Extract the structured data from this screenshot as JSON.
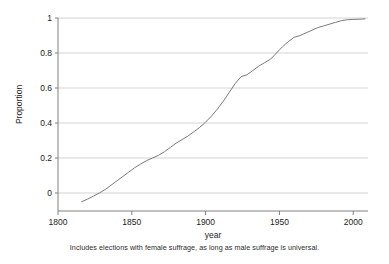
{
  "caption": "Includes elections with female suffrage, as long as male suffrage is universal.",
  "axis": {
    "y_title": "Proportion",
    "x_title": "year",
    "y_ticks": [
      "1",
      "0.8",
      "0.6",
      "0.4",
      "0.2",
      "0"
    ],
    "x_ticks": [
      "1800",
      "1850",
      "1900",
      "1950",
      "2000"
    ]
  },
  "colors": {
    "line": "#7a7a7a",
    "grid": "#c8c8c8",
    "axis": "#808080",
    "text": "#222222",
    "background": "#ffffff"
  },
  "chart_data": {
    "type": "line",
    "title": "",
    "subtitle": "",
    "xlabel": "year",
    "ylabel": "Proportion",
    "xlim": [
      1800,
      2010
    ],
    "ylim": [
      -0.12,
      1.0
    ],
    "grid": true,
    "legend": "none",
    "y_tick_values": [
      0,
      0.2,
      0.4,
      0.6,
      0.8,
      1
    ],
    "x_tick_values": [
      1800,
      1850,
      1900,
      1950,
      2000
    ],
    "annotation": "Includes elections with female suffrage, as long as male suffrage is universal.",
    "series": [
      {
        "name": "Proportion of elections with universal male suffrage",
        "x": [
          1816,
          1820,
          1824,
          1828,
          1832,
          1836,
          1840,
          1844,
          1848,
          1852,
          1856,
          1860,
          1864,
          1868,
          1872,
          1876,
          1880,
          1884,
          1888,
          1892,
          1896,
          1900,
          1904,
          1908,
          1912,
          1916,
          1920,
          1924,
          1928,
          1932,
          1936,
          1940,
          1944,
          1948,
          1952,
          1956,
          1960,
          1964,
          1968,
          1972,
          1976,
          1980,
          1984,
          1988,
          1992,
          1996,
          2000,
          2004,
          2008
        ],
        "y": [
          -0.05,
          -0.035,
          -0.018,
          0.0,
          0.02,
          0.045,
          0.07,
          0.095,
          0.12,
          0.145,
          0.165,
          0.185,
          0.2,
          0.215,
          0.235,
          0.26,
          0.285,
          0.305,
          0.325,
          0.35,
          0.375,
          0.405,
          0.44,
          0.48,
          0.525,
          0.575,
          0.625,
          0.665,
          0.675,
          0.7,
          0.725,
          0.745,
          0.765,
          0.8,
          0.835,
          0.865,
          0.89,
          0.9,
          0.915,
          0.93,
          0.945,
          0.955,
          0.965,
          0.975,
          0.985,
          0.99,
          0.992,
          0.993,
          0.995
        ]
      }
    ]
  }
}
